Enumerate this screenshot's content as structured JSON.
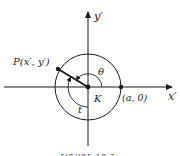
{
  "figure": {
    "caption": "FIGURE 10.2",
    "labels": {
      "y_axis": "y′",
      "x_axis": "x′",
      "point_p": "P(x′, y′)",
      "point_a": "(a, 0)",
      "center": "K",
      "angle_theta": "θ",
      "arc_t": "t"
    },
    "colors": {
      "ink": "#1a1a1a",
      "background": "#ffffff"
    },
    "geometry": {
      "center": [
        88,
        87
      ],
      "circle_radius": 33,
      "point_p": [
        58,
        69
      ],
      "point_a": [
        121,
        87
      ]
    }
  }
}
